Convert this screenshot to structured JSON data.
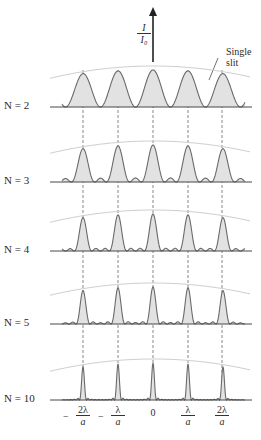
{
  "figure": {
    "y_axis_label_num": "I",
    "y_axis_label_den": "I₀",
    "single_slit_label_line1": "Single",
    "single_slit_label_line2": "slit"
  },
  "rows": [
    {
      "label": "N = 2",
      "n": 2,
      "baseline": 107
    },
    {
      "label": "N = 3",
      "n": 3,
      "baseline": 182
    },
    {
      "label": "N = 4",
      "n": 4,
      "baseline": 251
    },
    {
      "label": "N = 5",
      "n": 5,
      "baseline": 324
    },
    {
      "label": "N = 10",
      "n": 10,
      "baseline": 400
    }
  ],
  "x_ticks": [
    {
      "sign": "−",
      "num": "2λ",
      "den": "a",
      "x": 83
    },
    {
      "sign": "−",
      "num": "λ",
      "den": "a",
      "x": 118
    },
    {
      "sign": "",
      "num": "0",
      "den": "",
      "x": 153
    },
    {
      "sign": "",
      "num": "λ",
      "den": "a",
      "x": 188
    },
    {
      "sign": "",
      "num": "2λ",
      "den": "a",
      "x": 222
    }
  ],
  "colors": {
    "curve": "#6a6a6a",
    "fill": "#e2e2e2",
    "envelope": "#cfcfcf",
    "axis": "#333333"
  }
}
